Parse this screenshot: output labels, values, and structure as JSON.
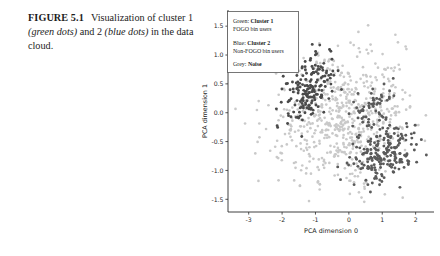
{
  "caption": {
    "figure_label": "FIGURE 5.1",
    "part1": "Visualization of cluster",
    "part2_pre": "1 ",
    "part2_ital": "(green dots)",
    "part2_mid": " and 2 ",
    "part3_ital": "(blue dots)",
    "part3_post": " in the",
    "part4": "data cloud."
  },
  "legend": {
    "entries": [
      {
        "color_name": "Green:",
        "cluster": "Cluster 1",
        "desc": "FOGO bin users"
      },
      {
        "color_name": "Blue:",
        "cluster": "Cluster 2",
        "desc": "Non-FOGO bin users"
      },
      {
        "color_name": "Grey:",
        "cluster": "Noise",
        "desc": ""
      }
    ]
  },
  "chart_data": {
    "type": "scatter",
    "title": "",
    "xlabel": "PCA dimension 0",
    "ylabel": "PCA dimension 1",
    "xlim": [
      -3.62,
      2.55
    ],
    "ylim": [
      -1.72,
      1.78
    ],
    "xticks": [
      -3,
      -2,
      -1,
      0,
      1,
      2
    ],
    "xtick_labels": [
      "-3",
      "-2",
      "-1",
      "0",
      "1",
      "2"
    ],
    "yticks": [
      -1.5,
      -1.0,
      -0.5,
      0.0,
      0.5,
      1.0,
      1.5
    ],
    "ytick_labels": [
      "-1.5",
      "-1.0",
      "-0.5",
      "0.0",
      "0.5",
      "1.0",
      "1.5"
    ],
    "grid": false,
    "legend_position": "upper-left",
    "colors": {
      "cluster1": "#4a4a4a",
      "cluster2": "#5a5a5a",
      "noise": "#c9c9c9"
    },
    "marker_size": 1.45,
    "series": [
      {
        "name": "Cluster 1",
        "label": "Green: Cluster 1 / FOGO bin users",
        "color": "#4a4a4a",
        "n_points": 175,
        "center": [
          -1.18,
          0.42
        ],
        "spread": [
          0.45,
          0.3
        ],
        "correlation": 0.55,
        "seed": 1187
      },
      {
        "name": "Cluster 2",
        "label": "Blue: Cluster 2 / Non-FOGO bin users",
        "color": "#5a5a5a",
        "n_points": 205,
        "center": [
          1.02,
          -0.72
        ],
        "spread": [
          0.48,
          0.24
        ],
        "correlation": 0.3,
        "seed": 7741
      },
      {
        "name": "Cluster 2 upper lobe",
        "label": "Blue: Cluster 2 / Non-FOGO bin users",
        "color": "#5a5a5a",
        "n_points": 58,
        "center": [
          0.72,
          0.08
        ],
        "spread": [
          0.3,
          0.22
        ],
        "correlation": 0.25,
        "seed": 3312
      },
      {
        "name": "Noise",
        "label": "Grey: Noise",
        "color": "#c9c9c9",
        "n_points": 620,
        "center": [
          -0.18,
          -0.08
        ],
        "spread": [
          1.05,
          0.62
        ],
        "correlation": 0.22,
        "seed": 9031
      }
    ]
  }
}
